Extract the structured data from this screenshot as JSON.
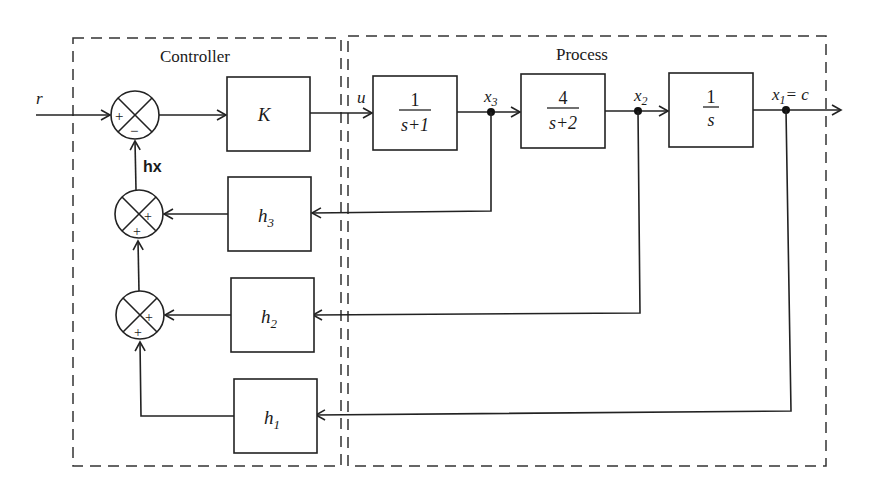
{
  "diagram": {
    "type": "block-diagram",
    "regions": {
      "controller": {
        "label": "Controller"
      },
      "process": {
        "label": "Process"
      }
    },
    "signals": {
      "reference": "r",
      "control": "u",
      "feedback_sum": "hx",
      "x3": "x",
      "x3_sub": "3",
      "x2": "x",
      "x2_sub": "2",
      "x1": "x",
      "x1_sub": "1",
      "x1_eq": "= c"
    },
    "blocks": {
      "gain": {
        "label": "K"
      },
      "g1": {
        "num": "1",
        "den": "s+1"
      },
      "g2": {
        "num": "4",
        "den": "s+2"
      },
      "g3": {
        "num": "1",
        "den": "s"
      },
      "h3": {
        "label": "h",
        "sub": "3"
      },
      "h2": {
        "label": "h",
        "sub": "2"
      },
      "h1": {
        "label": "h",
        "sub": "1"
      }
    },
    "summing_junctions": {
      "main": {
        "left": "+",
        "bottom": "−"
      },
      "sum_h3": {
        "right": "+",
        "bottom": "+"
      },
      "sum_h2": {
        "right": "+",
        "bottom": "+"
      }
    }
  }
}
